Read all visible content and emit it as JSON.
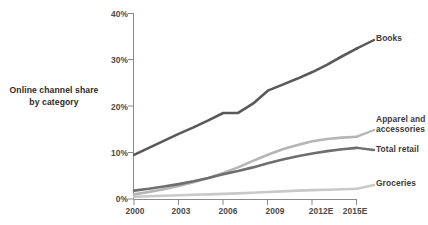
{
  "title": {
    "line1": "Online channel share",
    "line2": "by category"
  },
  "chart_data": {
    "type": "line",
    "title": "Online channel share by category",
    "xlabel": "",
    "ylabel": "",
    "x": [
      2000,
      2001,
      2002,
      2003,
      2004,
      2005,
      2006,
      2007,
      2008,
      2009,
      2010,
      2011,
      2012,
      2013,
      2014,
      2015
    ],
    "xticks": [
      "2000",
      "2003",
      "2006",
      "2009",
      "2012E",
      "2015E"
    ],
    "xtick_values": [
      2000,
      2003,
      2006,
      2009,
      2012,
      2015
    ],
    "yticks": [
      "0%",
      "10%",
      "20%",
      "30%",
      "40%"
    ],
    "ytick_values": [
      0,
      10,
      20,
      30,
      40
    ],
    "ylim": [
      0,
      40
    ],
    "xlim": [
      2000,
      2015
    ],
    "grid": false,
    "legend_position": "right-inline",
    "series": [
      {
        "name": "Books",
        "color": "#595959",
        "values": [
          9.5,
          11.0,
          12.5,
          14.0,
          15.4,
          16.9,
          18.5,
          18.5,
          20.5,
          23.3,
          24.6,
          25.9,
          27.3,
          28.9,
          30.7,
          32.4
        ]
      },
      {
        "name": "Apparel and accessories",
        "color": "#b5b5b5",
        "values": [
          1.0,
          1.5,
          2.1,
          2.8,
          3.6,
          4.5,
          5.6,
          6.8,
          8.2,
          9.5,
          10.7,
          11.6,
          12.4,
          12.9,
          13.2,
          13.4
        ]
      },
      {
        "name": "Total retail",
        "color": "#6e6e6e",
        "values": [
          1.8,
          2.2,
          2.7,
          3.2,
          3.8,
          4.5,
          5.3,
          6.0,
          6.8,
          7.7,
          8.5,
          9.2,
          9.8,
          10.3,
          10.7,
          11.0
        ]
      },
      {
        "name": "Groceries",
        "color": "#c9c9c9",
        "values": [
          0.5,
          0.6,
          0.7,
          0.8,
          0.9,
          1.0,
          1.1,
          1.2,
          1.35,
          1.5,
          1.65,
          1.8,
          1.9,
          2.0,
          2.1,
          2.2
        ]
      }
    ]
  },
  "series_labels": {
    "books": "Books",
    "apparel_line1": "Apparel and",
    "apparel_line2": "accessories",
    "total_retail": "Total retail",
    "groceries": "Groceries"
  },
  "axis": {
    "y": [
      "40%",
      "30%",
      "20%",
      "10%",
      "0%"
    ],
    "x": [
      "2000",
      "2003",
      "2006",
      "2009",
      "2012E",
      "2015E"
    ]
  },
  "colors": {
    "books": "#595959",
    "apparel": "#b5b5b5",
    "total_retail": "#6e6e6e",
    "groceries": "#c9c9c9",
    "axis": "#7a7a7a",
    "text": "#3a3a3a"
  }
}
